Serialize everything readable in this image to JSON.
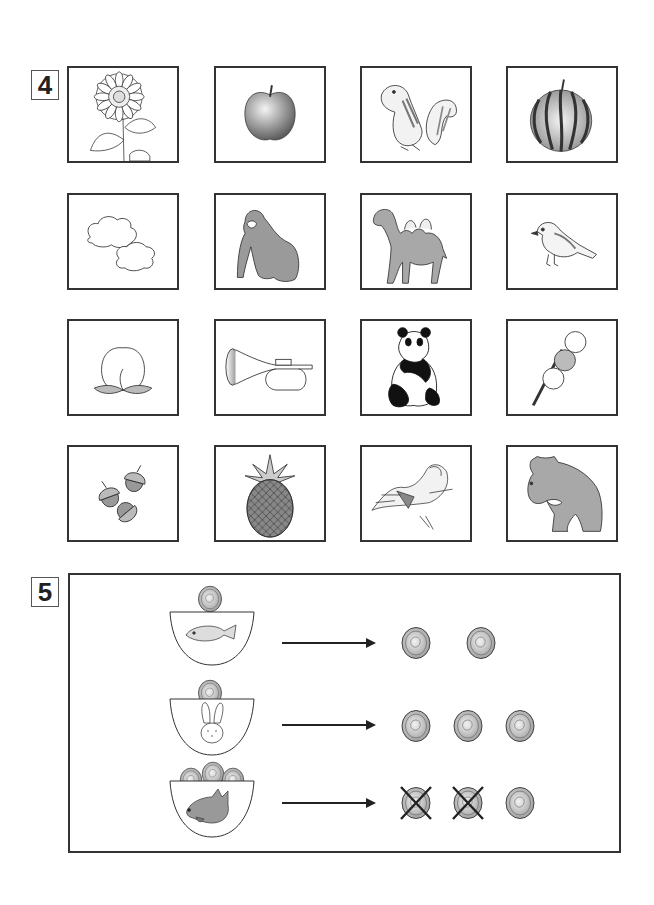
{
  "question4": {
    "number": "4",
    "rows": [
      [
        {
          "label": "sunflower"
        },
        {
          "label": "apple"
        },
        {
          "label": "chipmunk"
        },
        {
          "label": "watermelon"
        }
      ],
      [
        {
          "label": "clouds"
        },
        {
          "label": "gorilla"
        },
        {
          "label": "camel"
        },
        {
          "label": "sparrow"
        }
      ],
      [
        {
          "label": "peach"
        },
        {
          "label": "trumpet"
        },
        {
          "label": "panda"
        },
        {
          "label": "dango"
        }
      ],
      [
        {
          "label": "acorns"
        },
        {
          "label": "pineapple"
        },
        {
          "label": "sea-otter"
        },
        {
          "label": "bear"
        }
      ]
    ]
  },
  "question5": {
    "number": "5",
    "rows": [
      {
        "animal": "fish",
        "coins_in_bowl": 1,
        "result_coins": 2,
        "crossed_coins": 0
      },
      {
        "animal": "rabbit",
        "coins_in_bowl": 1,
        "result_coins": 3,
        "crossed_coins": 0
      },
      {
        "animal": "wolf",
        "coins_in_bowl": 3,
        "result_coins": 3,
        "crossed_coins": 2
      }
    ]
  },
  "colors": {
    "border": "#333333",
    "coin_fill": "#d8d8d8",
    "animal_gray": "#9a9a9a"
  }
}
